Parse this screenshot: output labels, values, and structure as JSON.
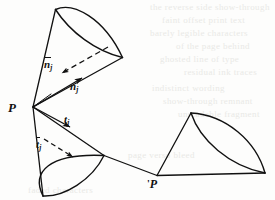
{
  "figure": {
    "caption_visible": false,
    "background_color": "#fdfdfc",
    "ink_color": "#111111",
    "width": 275,
    "height": 200,
    "points": [
      {
        "id": "P",
        "label": "P",
        "x": 33,
        "y": 107
      },
      {
        "id": "Pprime",
        "label": "P",
        "prime": "'",
        "x": 158,
        "y": 175
      }
    ],
    "vectors": [
      {
        "id": "n-bar-j",
        "base": "n",
        "overbar": true,
        "subscript": "j",
        "style": "dashed",
        "label_x": 44,
        "label_y": 59
      },
      {
        "id": "n-j",
        "base": "n",
        "overbar": false,
        "subscript": "j",
        "style": "solid",
        "label_x": 70,
        "label_y": 81
      },
      {
        "id": "t-bar-j",
        "base": "t",
        "overbar": true,
        "subscript": "j",
        "style": "dashed",
        "label_x": 36,
        "label_y": 139
      },
      {
        "id": "t-j",
        "base": "t",
        "overbar": false,
        "subscript": "j",
        "style": "solid",
        "label_x": 64,
        "label_y": 114
      }
    ],
    "labels": {
      "apex_p": "P",
      "apex_p_prime_mark": "'",
      "apex_p_prime": "P",
      "n_bar_base": "n",
      "n_bar_sub": "j",
      "n_base": "n",
      "n_sub": "j",
      "t_bar_base": "t",
      "t_bar_sub": "j",
      "t_base": "t",
      "t_sub": "j"
    },
    "cones": [
      {
        "id": "upper-cone",
        "apex": "P",
        "opening": "ellipse",
        "orientation": "up-right"
      },
      {
        "id": "lower-cone",
        "apex": "P",
        "opening": "ellipse",
        "orientation": "down-right"
      },
      {
        "id": "right-cone",
        "apex": "Pprime",
        "opening": "ellipse",
        "orientation": "right"
      }
    ],
    "bleed_through": [
      {
        "text": "the reverse side show-through",
        "x": 150,
        "y": 6
      },
      {
        "text": "faint offset print text",
        "x": 160,
        "y": 18
      },
      {
        "text": "barely legible characters",
        "x": 150,
        "y": 31
      },
      {
        "text": "of the page behind",
        "x": 172,
        "y": 44
      },
      {
        "text": "ghosted line of type",
        "x": 160,
        "y": 57
      },
      {
        "text": "residual ink traces",
        "x": 180,
        "y": 70
      },
      {
        "text": "indistinct wording",
        "x": 150,
        "y": 86
      },
      {
        "text": "show-through remnant",
        "x": 160,
        "y": 99
      },
      {
        "text": "unreadable fragment",
        "x": 175,
        "y": 112
      },
      {
        "text": "faded characters",
        "x": 30,
        "y": 186
      },
      {
        "text": "page verso bleed",
        "x": 125,
        "y": 150
      }
    ]
  }
}
